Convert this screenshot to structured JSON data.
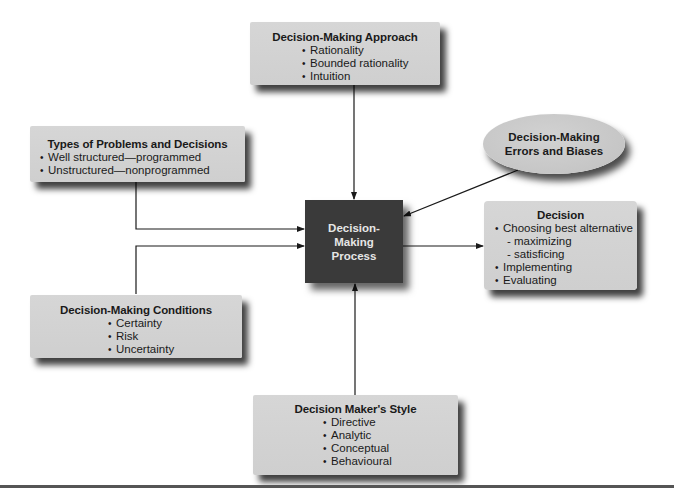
{
  "diagram": {
    "type": "flow",
    "center": {
      "lines": [
        "Decision-",
        "Making",
        "Process"
      ]
    },
    "approach": {
      "title": "Decision-Making Approach",
      "items": [
        "Rationality",
        "Bounded rationality",
        "Intuition"
      ]
    },
    "types": {
      "title": "Types of Problems and Decisions",
      "items": [
        "Well structured—programmed",
        "Unstructured—nonprogrammed"
      ]
    },
    "errors": {
      "lines": [
        "Decision-Making",
        "Errors and Biases"
      ]
    },
    "decision": {
      "title": "Decision",
      "items": [
        {
          "text": "Choosing best alternative",
          "level": 1
        },
        {
          "text": "- maximizing",
          "level": 2
        },
        {
          "text": "- satisficing",
          "level": 2
        },
        {
          "text": "Implementing",
          "level": 1
        },
        {
          "text": "Evaluating",
          "level": 1
        }
      ]
    },
    "conditions": {
      "title": "Decision-Making Conditions",
      "items": [
        "Certainty",
        "Risk",
        "Uncertainty"
      ]
    },
    "style": {
      "title": "Decision Maker's Style",
      "items": [
        "Directive",
        "Analytic",
        "Conceptual",
        "Behavioural"
      ]
    },
    "bullet": "•",
    "edges": [
      {
        "from": "approach",
        "to": "center"
      },
      {
        "from": "types",
        "to": "center"
      },
      {
        "from": "conditions",
        "to": "center"
      },
      {
        "from": "errors",
        "to": "center"
      },
      {
        "from": "style",
        "to": "center"
      },
      {
        "from": "center",
        "to": "decision"
      }
    ],
    "colors": {
      "box_fill": "#d3d3d3",
      "center_fill": "#3a3a3a",
      "center_text": "#e6e6e6",
      "line": "#1a1a1a"
    }
  }
}
